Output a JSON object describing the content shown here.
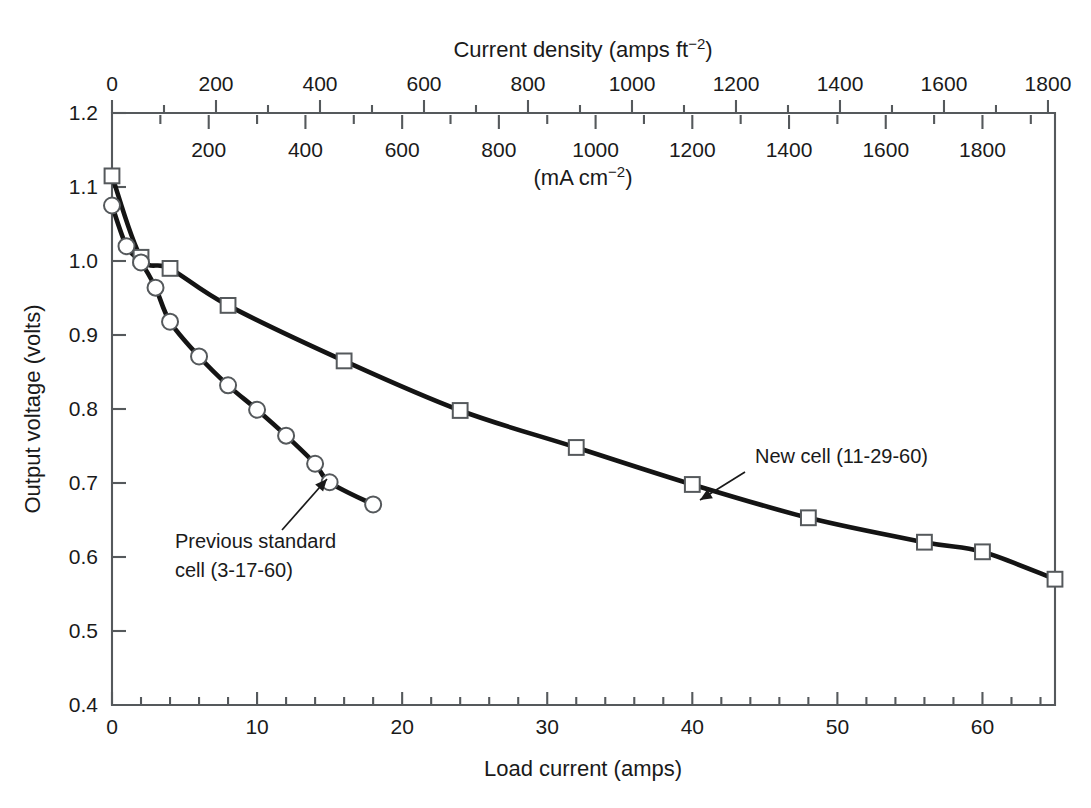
{
  "chart_data": {
    "type": "line",
    "title": "",
    "xlabel": "Load current (amps)",
    "ylabel": "Output voltage (volts)",
    "xlim": [
      0,
      65
    ],
    "ylim": [
      0.4,
      1.2
    ],
    "grid": false,
    "legend_position": "inline-annotations",
    "axes": {
      "bottom": {
        "label": "Load current (amps)",
        "ticks": [
          0,
          10,
          20,
          30,
          40,
          50,
          60
        ],
        "tick_labels": [
          "0",
          "10",
          "20",
          "30",
          "40",
          "50",
          "60"
        ],
        "minor_step": 2
      },
      "top_primary": {
        "label": "Current density (amps ft",
        "label_sup": "−2",
        "label_tail": ")",
        "label_full": "Current density (amps ft−2)",
        "ticks": [
          0,
          200,
          400,
          600,
          800,
          1000,
          1200,
          1400,
          1600,
          1800
        ],
        "tick_labels": [
          "0",
          "200",
          "400",
          "600",
          "800",
          "1000",
          "1200",
          "1400",
          "1600",
          "1800"
        ],
        "units_per_amp": 27.9,
        "minor_step": 100
      },
      "top_secondary": {
        "label_full": "(mA cm−2)",
        "label": "(mA cm",
        "label_sup": "−2",
        "label_tail": ")",
        "ticks": [
          200,
          400,
          600,
          800,
          1000,
          1200,
          1400,
          1600,
          1800
        ],
        "tick_labels": [
          "200",
          "400",
          "600",
          "800",
          "1000",
          "1200",
          "1400",
          "1600",
          "1800"
        ],
        "units_per_amp": 30.0,
        "minor_step": 100
      },
      "left": {
        "label": "Output voltage (volts)",
        "ticks": [
          0.4,
          0.5,
          0.6,
          0.7,
          0.8,
          0.9,
          1.0,
          1.1,
          1.2
        ],
        "tick_labels": [
          "0.4",
          "0.5",
          "0.6",
          "0.7",
          "0.8",
          "0.9",
          "1.0",
          "1.1",
          "1.2"
        ]
      }
    },
    "series": [
      {
        "name": "New cell (11-29-60)",
        "marker": "square",
        "annotation": "New cell (11-29-60)",
        "x": [
          0.0,
          2.0,
          4.0,
          8.0,
          16.0,
          24.0,
          32.0,
          40.0,
          48.0,
          56.0,
          60.0,
          65.0
        ],
        "values": [
          1.115,
          1.005,
          0.99,
          0.94,
          0.865,
          0.798,
          0.748,
          0.698,
          0.653,
          0.62,
          0.607,
          0.57
        ],
        "points": [
          {
            "x": 0.0,
            "y": 1.115
          },
          {
            "x": 2.0,
            "y": 1.005
          },
          {
            "x": 4.0,
            "y": 0.99
          },
          {
            "x": 8.0,
            "y": 0.94
          },
          {
            "x": 16.0,
            "y": 0.865
          },
          {
            "x": 24.0,
            "y": 0.798
          },
          {
            "x": 32.0,
            "y": 0.748
          },
          {
            "x": 40.0,
            "y": 0.698
          },
          {
            "x": 48.0,
            "y": 0.653
          },
          {
            "x": 56.0,
            "y": 0.62
          },
          {
            "x": 60.0,
            "y": 0.607
          },
          {
            "x": 65.0,
            "y": 0.57
          }
        ]
      },
      {
        "name": "Previous standard cell (3-17-60)",
        "marker": "circle",
        "annotation_line1": "Previous standard",
        "annotation_line2": "cell (3-17-60)",
        "x": [
          0.0,
          1.0,
          2.0,
          3.0,
          4.0,
          6.0,
          8.0,
          10.0,
          12.0,
          14.0,
          15.0,
          18.0
        ],
        "values": [
          1.075,
          1.02,
          0.998,
          0.964,
          0.918,
          0.871,
          0.832,
          0.799,
          0.764,
          0.726,
          0.701,
          0.671
        ],
        "points": [
          {
            "x": 0.0,
            "y": 1.075
          },
          {
            "x": 1.0,
            "y": 1.02
          },
          {
            "x": 2.0,
            "y": 0.998
          },
          {
            "x": 3.0,
            "y": 0.964
          },
          {
            "x": 4.0,
            "y": 0.918
          },
          {
            "x": 6.0,
            "y": 0.871
          },
          {
            "x": 8.0,
            "y": 0.832
          },
          {
            "x": 10.0,
            "y": 0.799
          },
          {
            "x": 12.0,
            "y": 0.764
          },
          {
            "x": 14.0,
            "y": 0.726
          },
          {
            "x": 15.0,
            "y": 0.701
          },
          {
            "x": 18.0,
            "y": 0.671
          }
        ]
      }
    ],
    "annotations": [
      {
        "id": "new-cell",
        "text": "New cell (11-29-60)",
        "text_x": 755,
        "text_y": 463,
        "leader_from": [
          745,
          472
        ],
        "leader_to": [
          700,
          500
        ]
      },
      {
        "id": "previous-cell",
        "text_line1": "Previous standard",
        "text_line2": "cell (3-17-60)",
        "line1_x": 175,
        "line1_y": 548,
        "line2_x": 175,
        "line2_y": 577,
        "leader_from": [
          282,
          530
        ],
        "leader_to": [
          327,
          479
        ]
      }
    ],
    "colors": {
      "curve": "#141414",
      "axis": "#55595c",
      "marker_fill": "#ffffff",
      "text": "#1a1a1a",
      "background": "#ffffff"
    }
  }
}
